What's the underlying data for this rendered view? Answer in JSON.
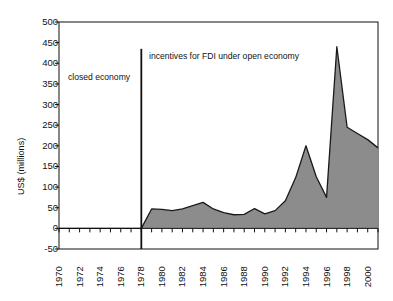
{
  "chart_data": {
    "type": "area",
    "title": "",
    "xlabel": "",
    "ylabel": "US$ (millions)",
    "ylim": [
      -50,
      500
    ],
    "xlim": [
      1970,
      2001
    ],
    "grid": false,
    "legend": null,
    "y_ticks": [
      500,
      450,
      400,
      350,
      300,
      250,
      200,
      150,
      100,
      50,
      0,
      -50
    ],
    "x_tick_labels": [
      1970,
      1972,
      1974,
      1976,
      1978,
      1980,
      1982,
      1984,
      1986,
      1988,
      1990,
      1992,
      1994,
      1996,
      1998,
      2000
    ],
    "x_minor_ticks_every": 1,
    "series": [
      {
        "name": "FDI inflows",
        "fill_color": "#8c8c8c",
        "line_color": "#1a1a1a",
        "x": [
          1970,
          1971,
          1972,
          1973,
          1974,
          1975,
          1976,
          1977,
          1978,
          1979,
          1980,
          1981,
          1982,
          1983,
          1984,
          1985,
          1986,
          1987,
          1988,
          1989,
          1990,
          1991,
          1992,
          1993,
          1994,
          1995,
          1996,
          1997,
          1998,
          1999,
          2000,
          2001
        ],
        "values": [
          0,
          0,
          0,
          0,
          0,
          0,
          0,
          0,
          0,
          47,
          46,
          43,
          47,
          55,
          63,
          47,
          38,
          33,
          34,
          48,
          35,
          43,
          67,
          123,
          200,
          125,
          75,
          440,
          245,
          230,
          215,
          195
        ]
      }
    ],
    "annotations": [
      {
        "name": "closed-economy",
        "text": "closed economy",
        "x": 1971.2,
        "y": 385
      },
      {
        "name": "open-economy",
        "text": "incentives for FDI under open economy",
        "x": 1978.4,
        "y": 440
      }
    ],
    "vertical_marker": {
      "name": "regime-divider",
      "x": 1978,
      "y_from": -50,
      "y_to": 435,
      "color": "#111111"
    },
    "colors": {
      "area_fill": "#8c8c8c",
      "area_line": "#1a1a1a",
      "axis": "#111111",
      "background": "#ffffff"
    }
  }
}
